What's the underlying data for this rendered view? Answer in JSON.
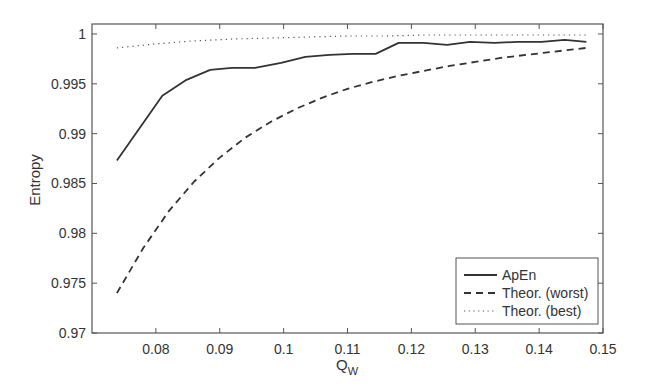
{
  "chart_data": {
    "type": "line",
    "title": "",
    "xlabel": "Q",
    "xlabel_subscript": "W",
    "ylabel": "Entropy",
    "xlim": [
      0.07,
      0.15
    ],
    "ylim": [
      0.97,
      1.001
    ],
    "xticks": [
      0.08,
      0.09,
      0.1,
      0.11,
      0.12,
      0.13,
      0.14,
      0.15
    ],
    "xtick_labels": [
      "0.08",
      "0.09",
      "0.1",
      "0.11",
      "0.12",
      "0.13",
      "0.14",
      "0.15"
    ],
    "yticks": [
      0.97,
      0.975,
      0.98,
      0.985,
      0.99,
      0.995,
      1
    ],
    "ytick_labels": [
      "0.97",
      "0.975",
      "0.98",
      "0.985",
      "0.99",
      "0.995",
      "1"
    ],
    "grid": false,
    "legend_position": "lower right",
    "series": [
      {
        "name": "ApEn",
        "style": "solid",
        "x": [
          0.0739,
          0.081,
          0.0848,
          0.0885,
          0.0919,
          0.0955,
          0.0996,
          0.1034,
          0.1072,
          0.1108,
          0.1144,
          0.118,
          0.1219,
          0.1256,
          0.1292,
          0.133,
          0.1366,
          0.1404,
          0.144,
          0.1474
        ],
        "y": [
          0.9873,
          0.9938,
          0.9954,
          0.9964,
          0.9966,
          0.9966,
          0.9971,
          0.9977,
          0.9979,
          0.998,
          0.998,
          0.9991,
          0.9991,
          0.9989,
          0.9992,
          0.9991,
          0.9992,
          0.9992,
          0.9994,
          0.9992
        ]
      },
      {
        "name": "Theor. (worst)",
        "style": "dashed",
        "x": [
          0.0739,
          0.078,
          0.082,
          0.086,
          0.09,
          0.094,
          0.098,
          0.102,
          0.106,
          0.11,
          0.114,
          0.118,
          0.122,
          0.126,
          0.13,
          0.134,
          0.138,
          0.142,
          0.1474
        ],
        "y": [
          0.974,
          0.9785,
          0.9822,
          0.9852,
          0.9876,
          0.9896,
          0.9912,
          0.9925,
          0.9936,
          0.9945,
          0.9952,
          0.9958,
          0.9963,
          0.9968,
          0.9972,
          0.9976,
          0.9979,
          0.9982,
          0.9986
        ]
      },
      {
        "name": "Theor. (best)",
        "style": "dotted",
        "x": [
          0.0739,
          0.08,
          0.086,
          0.092,
          0.098,
          0.104,
          0.11,
          0.116,
          0.122,
          0.128,
          0.134,
          0.14,
          0.1474
        ],
        "y": [
          0.9986,
          0.999,
          0.9993,
          0.9995,
          0.9996,
          0.9997,
          0.9998,
          0.9998,
          0.9999,
          0.9999,
          0.9999,
          0.9999,
          0.9999
        ]
      }
    ]
  },
  "legend": {
    "items": [
      {
        "label": "ApEn",
        "style": "solid"
      },
      {
        "label": "Theor. (worst)",
        "style": "dashed"
      },
      {
        "label": "Theor. (best)",
        "style": "dotted"
      }
    ]
  },
  "colors": {
    "line": "#333333",
    "axis": "#555555",
    "background": "#ffffff"
  }
}
